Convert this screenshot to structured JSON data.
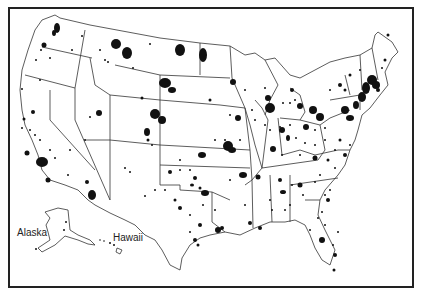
{
  "map": {
    "type": "dot-distribution",
    "region": "United States",
    "labels": {
      "alaska": "Alaska",
      "hawaii": "Hawaii"
    },
    "colors": {
      "background": "#ffffff",
      "border": "#222222",
      "state_lines": "#333333",
      "dots": "#111111"
    }
  }
}
